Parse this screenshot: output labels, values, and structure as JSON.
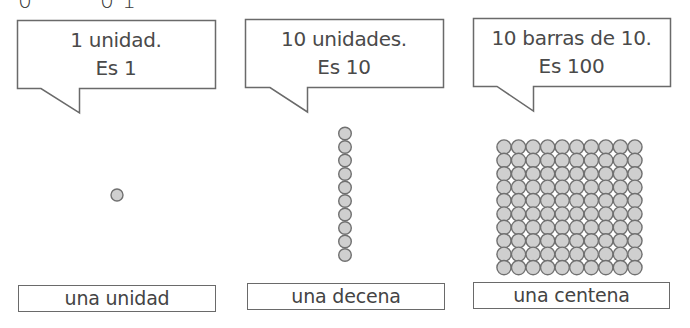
{
  "colors": {
    "stroke": "#6a6a6a",
    "text": "#444444",
    "bead_fill": "#cfcfcf",
    "bead_stroke": "#707070",
    "background": "#ffffff"
  },
  "top_partial_glyphs": [
    "0",
    "0",
    "1"
  ],
  "panels": [
    {
      "bubble": {
        "line1": "1 unidad.",
        "line2": "Es 1"
      },
      "beads": {
        "shape": "single",
        "rows": 1,
        "cols": 1,
        "count": 1
      },
      "label": "una unidad"
    },
    {
      "bubble": {
        "line1": "10 unidades.",
        "line2": "Es 10"
      },
      "beads": {
        "shape": "vertical-bar",
        "rows": 10,
        "cols": 1,
        "count": 10
      },
      "label": "una decena"
    },
    {
      "bubble": {
        "line1": "10 barras de 10.",
        "line2": "Es 100"
      },
      "beads": {
        "shape": "square-grid",
        "rows": 10,
        "cols": 10,
        "count": 100
      },
      "label": "una centena"
    }
  ],
  "icons": {
    "bead": "circle"
  }
}
